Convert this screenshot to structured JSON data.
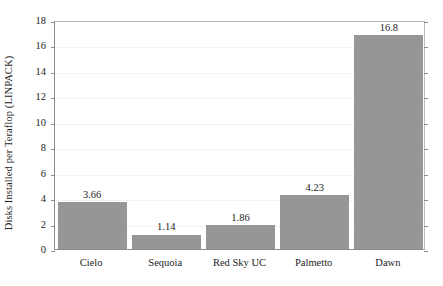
{
  "chart_data": {
    "type": "bar",
    "title": "",
    "subtitle": "",
    "xlabel": "",
    "ylabel": "Disks Installed per Teraflop (LINPACK)",
    "categories": [
      "Cielo",
      "Sequoia",
      "Red Sky UC",
      "Palmetto",
      "Dawn"
    ],
    "values": [
      3.66,
      1.14,
      1.86,
      4.23,
      16.8
    ],
    "value_labels": [
      "3.66",
      "1.14",
      "1.86",
      "4.23",
      "16.8"
    ],
    "ylim": [
      0,
      18
    ],
    "yticks": [
      0,
      2,
      4,
      6,
      8,
      10,
      12,
      14,
      16,
      18
    ],
    "ytick_labels": [
      "0",
      "2",
      "4",
      "6",
      "8",
      "10",
      "12",
      "14",
      "16",
      "18"
    ],
    "grid": true,
    "grid_axis": "y",
    "legend": false,
    "legend_position": "none",
    "bar_color": "#969696",
    "axis_color": "#8c8c8c",
    "gridline_color": "#f2f2f2",
    "text_color": "#1c1c1c",
    "background": "#ffffff"
  },
  "axes": {
    "y_title": "Disks Installed per Teraflop (LINPACK)"
  }
}
